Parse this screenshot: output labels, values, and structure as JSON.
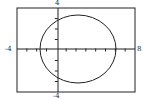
{
  "chart_data": {
    "type": "line",
    "title": "",
    "xlabel": "",
    "ylabel": "",
    "xlim": [
      -4,
      8
    ],
    "ylim": [
      -4,
      4
    ],
    "x_tick_step": 1,
    "y_tick_step": 1,
    "grid": false,
    "series": [
      {
        "name": "circle",
        "equation": "(x-2)^2 + y^2 = 16",
        "center": [
          2,
          0
        ],
        "radius": 4
      }
    ],
    "labels": {
      "x_min": "-4",
      "x_max": "8",
      "y_min": "-4",
      "y_max": "4"
    }
  },
  "colors": {
    "stroke": "#222222",
    "background": "#ffffff"
  }
}
